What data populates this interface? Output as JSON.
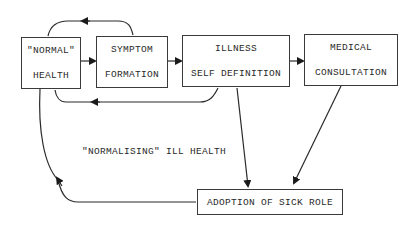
{
  "diagram": {
    "type": "flowchart",
    "nodes": {
      "normal_health": {
        "line1": "\"NORMAL\"",
        "line2": "HEALTH"
      },
      "symptom_formation": {
        "line1": "SYMPTOM",
        "line2": "FORMATION"
      },
      "illness_self_definition": {
        "line1": "ILLNESS",
        "line2": "SELF DEFINITION"
      },
      "medical_consultation": {
        "line1": "MEDICAL",
        "line2": "CONSULTATION"
      },
      "adoption_sick_role": {
        "line1": "ADOPTION OF SICK ROLE"
      }
    },
    "annotation": "\"NORMALISING\" ILL HEALTH",
    "edges": [
      {
        "from": "normal_health",
        "to": "symptom_formation"
      },
      {
        "from": "symptom_formation",
        "to": "normal_health",
        "style": "loop-over-top"
      },
      {
        "from": "symptom_formation",
        "to": "illness_self_definition"
      },
      {
        "from": "illness_self_definition",
        "to": "normal_health",
        "style": "loop-under-bottom"
      },
      {
        "from": "illness_self_definition",
        "to": "medical_consultation"
      },
      {
        "from": "illness_self_definition",
        "to": "adoption_sick_role"
      },
      {
        "from": "medical_consultation",
        "to": "adoption_sick_role"
      },
      {
        "from": "adoption_sick_role",
        "to": "normal_health",
        "style": "curved-left"
      }
    ]
  }
}
